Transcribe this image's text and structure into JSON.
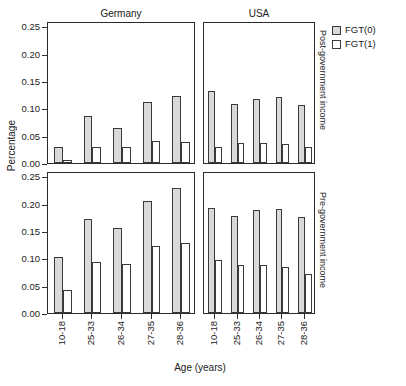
{
  "chart_data": {
    "type": "bar",
    "title": "",
    "xlabel": "Age (years)",
    "ylabel": "Percentage",
    "ylim": [
      0.0,
      0.26
    ],
    "yticks": [
      "0.00",
      "0.05",
      "0.10",
      "0.15",
      "0.20",
      "0.25"
    ],
    "ytick_values": [
      0.0,
      0.05,
      0.1,
      0.15,
      0.2,
      0.25
    ],
    "categories": [
      "10-18",
      "25-33",
      "26-34",
      "27-35",
      "28-36"
    ],
    "grid": false,
    "legend_position": "right-top",
    "legend": [
      {
        "name": "FGT(0)",
        "color": "#d9d9d9"
      },
      {
        "name": "FGT(1)",
        "color": "#ffffff"
      }
    ],
    "facet_columns": [
      "Germany",
      "USA"
    ],
    "facet_rows": [
      "Post-government income",
      "Pre-government income"
    ],
    "panels": [
      {
        "row": "Post-government income",
        "column": "Germany",
        "series": [
          {
            "name": "FGT(0)",
            "values": [
              0.03,
              0.086,
              0.065,
              0.112,
              0.122
            ]
          },
          {
            "name": "FGT(1)",
            "values": [
              0.006,
              0.03,
              0.03,
              0.04,
              0.038
            ]
          }
        ]
      },
      {
        "row": "Post-government income",
        "column": "USA",
        "series": [
          {
            "name": "FGT(0)",
            "values": [
              0.131,
              0.108,
              0.117,
              0.121,
              0.107
            ]
          },
          {
            "name": "FGT(1)",
            "values": [
              0.03,
              0.037,
              0.036,
              0.035,
              0.03
            ]
          }
        ]
      },
      {
        "row": "Pre-government income",
        "column": "Germany",
        "series": [
          {
            "name": "FGT(0)",
            "values": [
              0.103,
              0.172,
              0.156,
              0.206,
              0.228
            ]
          },
          {
            "name": "FGT(1)",
            "values": [
              0.043,
              0.094,
              0.09,
              0.122,
              0.128
            ]
          }
        ]
      },
      {
        "row": "Pre-government income",
        "column": "USA",
        "series": [
          {
            "name": "FGT(0)",
            "values": [
              0.192,
              0.178,
              0.188,
              0.191,
              0.175
            ]
          },
          {
            "name": "FGT(1)",
            "values": [
              0.097,
              0.087,
              0.088,
              0.084,
              0.072
            ]
          }
        ]
      }
    ],
    "colors": {
      "fgt0_fill": "#d9d9d9",
      "fgt1_fill": "#ffffff",
      "bar_stroke": "#3a3a3a",
      "panel_border": "#2b2b2b",
      "background": "#ffffff",
      "text": "#1a1a1a"
    }
  }
}
